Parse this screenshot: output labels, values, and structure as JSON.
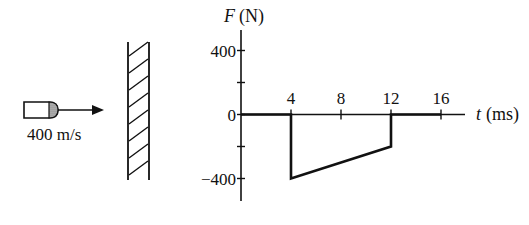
{
  "projectile": {
    "speed_label": "400 m/s",
    "icon": "bullet-icon",
    "direction": "right"
  },
  "wall": {
    "icon": "hatched-wall"
  },
  "chart_data": {
    "type": "line",
    "title": "",
    "xlabel_var": "t",
    "xlabel_unit": "(ms)",
    "ylabel_var": "F",
    "ylabel_unit": "(N)",
    "x_ticks": [
      0,
      4,
      8,
      12,
      16
    ],
    "x_tick_labels": [
      "4",
      "8",
      "12",
      "16"
    ],
    "y_ticks": [
      400,
      200,
      0,
      -200,
      -400
    ],
    "y_tick_labels": [
      "400",
      "0",
      "-400"
    ],
    "xlim": [
      0,
      17.5
    ],
    "ylim": [
      -520,
      520
    ],
    "grid": false,
    "series": [
      {
        "name": "Force on bullet",
        "points": [
          [
            0,
            0
          ],
          [
            4,
            0
          ],
          [
            4,
            -400
          ],
          [
            12,
            -200
          ],
          [
            12,
            0
          ],
          [
            16,
            0
          ]
        ]
      }
    ]
  }
}
